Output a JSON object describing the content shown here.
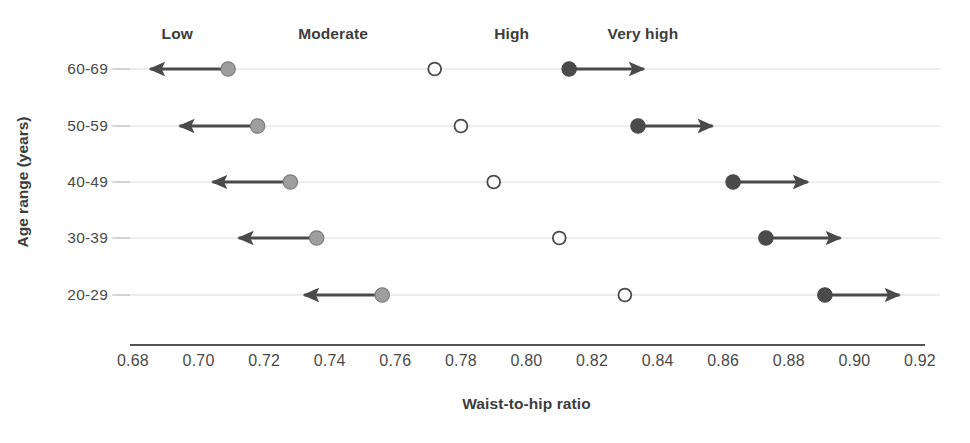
{
  "chart_data": {
    "type": "scatter",
    "title": "",
    "xlabel": "Waist-to-hip ratio",
    "ylabel": "Age range (years)",
    "xlim": [
      0.68,
      0.92
    ],
    "xticks": [
      "0.68",
      "0.70",
      "0.72",
      "0.74",
      "0.76",
      "0.78",
      "0.80",
      "0.82",
      "0.84",
      "0.86",
      "0.88",
      "0.90",
      "0.92"
    ],
    "xtick_values": [
      0.68,
      0.7,
      0.72,
      0.74,
      0.76,
      0.78,
      0.8,
      0.82,
      0.84,
      0.86,
      0.88,
      0.9,
      0.92
    ],
    "categories": [
      "60-69",
      "50-59",
      "40-49",
      "30-39",
      "20-29"
    ],
    "grid": true,
    "legend_position": "top",
    "zone_labels": [
      {
        "text": "Low",
        "x": 0.6935
      },
      {
        "text": "Moderate",
        "x": 0.741
      },
      {
        "text": "High",
        "x": 0.7955
      },
      {
        "text": "Very high",
        "x": 0.8355
      }
    ],
    "series": [
      {
        "name": "Low threshold",
        "marker": "filled-circle",
        "color": "#9e9e9e",
        "direction": "left",
        "values": [
          0.709,
          0.718,
          0.728,
          0.736,
          0.756
        ]
      },
      {
        "name": "Moderate / High boundary",
        "marker": "open-circle",
        "color": "#ffffff",
        "direction": "none",
        "values": [
          0.772,
          0.78,
          0.79,
          0.81,
          0.83
        ]
      },
      {
        "name": "Very high threshold",
        "marker": "filled-circle",
        "color": "#4a4a4a",
        "direction": "right",
        "values": [
          0.813,
          0.834,
          0.863,
          0.873,
          0.891
        ]
      }
    ],
    "arrow_lengths": [
      {
        "series": "Low threshold",
        "span": 0.0265
      },
      {
        "series": "Very high threshold",
        "span": 0.0255
      }
    ],
    "colors": {
      "low_marker": "#9e9e9e",
      "mid_marker_stroke": "#4a4a4a",
      "high_marker": "#4a4a4a",
      "arrow": "#4a4a4a",
      "gridline": "#dcdcdc",
      "axis": "#555555",
      "text": "#3d3d3d"
    }
  }
}
